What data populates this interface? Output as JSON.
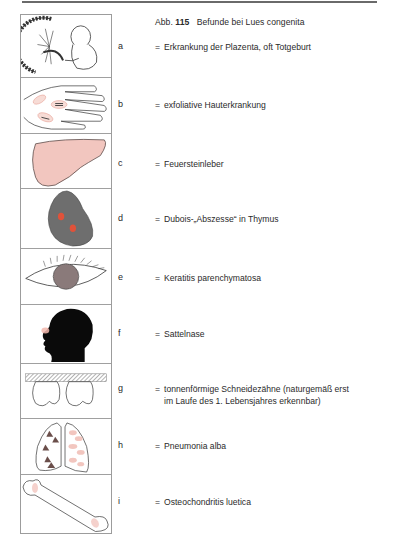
{
  "figure": {
    "prefix": "Abb.",
    "number": "115",
    "title": "Befunde bei Lues congenita"
  },
  "findings": [
    {
      "letter": "a",
      "eq": "=",
      "text": "Erkrankung der Plazenta, oft Totgeburt",
      "text2": "",
      "icon": "placenta-fetus-icon"
    },
    {
      "letter": "b",
      "eq": "=",
      "text": "exfoliative Hauterkrankung",
      "text2": "",
      "icon": "hand-skin-lesions-icon"
    },
    {
      "letter": "c",
      "eq": "=",
      "text": "Feuersteinleber",
      "text2": "",
      "icon": "liver-icon"
    },
    {
      "letter": "d",
      "eq": "=",
      "text": "Dubois-„Abszesse“ in Thymus",
      "text2": "",
      "icon": "thymus-icon"
    },
    {
      "letter": "e",
      "eq": "=",
      "text": "Keratitis parenchymatosa",
      "text2": "",
      "icon": "eye-icon"
    },
    {
      "letter": "f",
      "eq": "=",
      "text": "Sattelnase",
      "text2": "",
      "icon": "head-profile-icon"
    },
    {
      "letter": "g",
      "eq": "=",
      "text": "tonnenförmige Schneidezähne (naturgemäß erst",
      "text2": "im Laufe des 1. Lebensjahres erkennbar)",
      "icon": "incisor-teeth-icon"
    },
    {
      "letter": "h",
      "eq": "=",
      "text": "Pneumonia alba",
      "text2": "",
      "icon": "lungs-icon"
    },
    {
      "letter": "i",
      "eq": "=",
      "text": "Osteochondritis luetica",
      "text2": "",
      "icon": "bone-icon"
    }
  ],
  "colors": {
    "pink_fill": "#f2c6bf",
    "thymus_gray": "#6e6e6e",
    "abscess_red": "#e0523a",
    "outline": "#3a3a3a",
    "silhouette": "#0a0a0a"
  }
}
